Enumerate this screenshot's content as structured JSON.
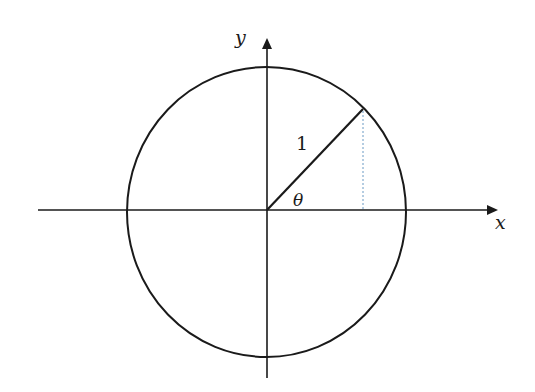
{
  "diagram": {
    "type": "unit-circle",
    "labels": {
      "x_axis": "x",
      "y_axis": "y",
      "radius": "1",
      "angle": "θ"
    },
    "colors": {
      "stroke": "#1a1a1a",
      "projection": "#6a9ac4",
      "background": "#ffffff"
    }
  }
}
